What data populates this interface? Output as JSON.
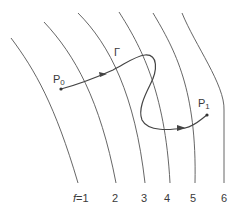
{
  "diagram": {
    "type": "level-curves-with-path",
    "colors": {
      "curve": "#555555",
      "path": "#444444",
      "text": "#3a3a3a",
      "background": "#ffffff"
    },
    "path": {
      "label": "Γ",
      "start": {
        "label": "P",
        "sub": "0"
      },
      "end": {
        "label": "P",
        "sub": "1"
      }
    },
    "level_curves": [
      {
        "var": "f",
        "eq": "=1",
        "value": "1"
      },
      {
        "value": "2"
      },
      {
        "value": "3"
      },
      {
        "value": "4"
      },
      {
        "value": "5"
      },
      {
        "value": "6"
      }
    ]
  }
}
